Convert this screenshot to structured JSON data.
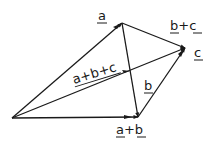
{
  "diagram": {
    "points": {
      "origin": {
        "x": 12,
        "y": 118
      },
      "top": {
        "x": 122,
        "y": 23
      },
      "right": {
        "x": 185,
        "y": 48
      },
      "bottom": {
        "x": 138,
        "y": 117
      }
    },
    "vectors": [
      {
        "id": "a",
        "from": "origin",
        "to": "top",
        "label": "a"
      },
      {
        "id": "b",
        "from": "top",
        "to": "bottom",
        "label": "b"
      },
      {
        "id": "c",
        "from": "bottom",
        "to": "right",
        "label": "c"
      },
      {
        "id": "a_plus_b",
        "from": "origin",
        "to": "bottom",
        "label": "a+b"
      },
      {
        "id": "b_plus_c",
        "from": "top",
        "to": "right",
        "label": "b+c"
      },
      {
        "id": "a_plus_b_plus_c",
        "from": "origin",
        "to": "right",
        "label": "a+b+c"
      }
    ],
    "labels": {
      "a": "a",
      "b": "b",
      "c": "c",
      "a_plus_b": "a+b",
      "b_plus_c": "b+c",
      "a_plus_b_plus_c": "a+b+c"
    },
    "stroke_color": "#1a1a1a"
  }
}
